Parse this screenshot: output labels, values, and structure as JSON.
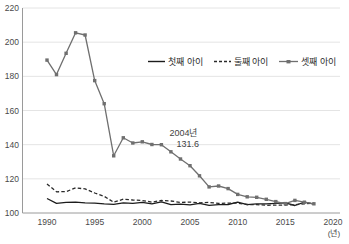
{
  "chart_data": {
    "type": "line",
    "title": "",
    "xlabel": "",
    "ylabel": "",
    "x_unit_label": "(년)",
    "x": [
      1990,
      1991,
      1992,
      1993,
      1994,
      1995,
      1996,
      1997,
      1998,
      1999,
      2000,
      2001,
      2002,
      2003,
      2004,
      2005,
      2006,
      2007,
      2008,
      2009,
      2010,
      2011,
      2012,
      2013,
      2014,
      2015,
      2016,
      2017,
      2018
    ],
    "xticks": [
      1990,
      1995,
      2000,
      2005,
      2010,
      2015,
      2020
    ],
    "yticks": [
      100,
      120,
      140,
      160,
      180,
      200,
      220
    ],
    "xlim": [
      1990,
      2020
    ],
    "ylim": [
      100,
      220
    ],
    "grid": true,
    "legend_position": "inside-top",
    "series": [
      {
        "name": "첫째 아이",
        "style": "solid",
        "color": "#1c1c1c",
        "values": [
          108.5,
          105.7,
          106.2,
          106.4,
          106.0,
          105.8,
          105.3,
          105.1,
          105.9,
          105.6,
          106.2,
          105.4,
          106.5,
          104.9,
          105.2,
          104.8,
          105.7,
          104.5,
          104.9,
          105.0,
          106.4,
          104.9,
          105.3,
          105.4,
          105.6,
          106.0,
          104.4,
          106.3,
          105.2
        ]
      },
      {
        "name": "둘째 아이",
        "style": "dashed",
        "color": "#2a2a2a",
        "values": [
          117.0,
          112.4,
          112.5,
          114.7,
          114.1,
          111.7,
          109.8,
          106.3,
          108.1,
          107.6,
          107.3,
          106.4,
          107.3,
          107.0,
          106.2,
          106.4,
          106.0,
          106.2,
          105.6,
          105.8,
          105.8,
          105.0,
          104.9,
          104.5,
          104.6,
          104.7,
          104.9,
          105.4,
          105.8
        ]
      },
      {
        "name": "셋째 아이",
        "style": "solid-square-marker",
        "color": "#6f6f6f",
        "values": [
          189.5,
          181.0,
          193.5,
          205.5,
          204.2,
          177.5,
          164.0,
          133.5,
          144.0,
          141.0,
          141.7,
          140.1,
          140.0,
          135.8,
          131.6,
          127.7,
          121.8,
          115.3,
          115.8,
          114.3,
          110.9,
          109.5,
          109.2,
          108.0,
          106.7,
          105.5,
          107.4,
          106.3,
          105.4
        ]
      }
    ],
    "annotation": {
      "text_line1": "2004년",
      "text_line2": "131.6",
      "x": 2004,
      "y": 131.6
    }
  },
  "colors": {
    "background": "#ffffff",
    "grid": "#e4e4e4",
    "axis": "#9a9a9a",
    "tick_text": "#4a4a4a",
    "annotation_text": "#3f3f3f"
  }
}
